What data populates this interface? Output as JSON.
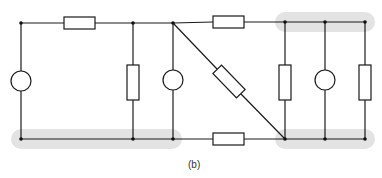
{
  "figure": {
    "label": "(b)",
    "label_position": {
      "x": 187,
      "y": 160
    }
  },
  "style": {
    "wire_color": "#1a1a1a",
    "highlight_color": "#e3e3e3",
    "background": "#ffffff",
    "wire_width": 1.2
  },
  "wires": {
    "top_y": 23,
    "bottom_y": 139
  },
  "nodes": [
    {
      "id": "n-top-left",
      "x": 21,
      "y": 23
    },
    {
      "id": "n-top-133",
      "x": 133,
      "y": 23
    },
    {
      "id": "n-top-173",
      "x": 173,
      "y": 23
    },
    {
      "id": "n-top-285",
      "x": 285,
      "y": 22
    },
    {
      "id": "n-top-325",
      "x": 325,
      "y": 22
    },
    {
      "id": "n-top-365",
      "x": 365,
      "y": 22
    },
    {
      "id": "n-bot-left",
      "x": 21,
      "y": 139
    },
    {
      "id": "n-bot-133",
      "x": 133,
      "y": 139
    },
    {
      "id": "n-bot-173",
      "x": 173,
      "y": 139
    },
    {
      "id": "n-bot-285",
      "x": 285,
      "y": 139
    },
    {
      "id": "n-bot-325",
      "x": 325,
      "y": 139
    },
    {
      "id": "n-bot-365",
      "x": 365,
      "y": 139
    }
  ],
  "highlights": [
    {
      "id": "top-right-node-group",
      "x": 275,
      "y": 12,
      "width": 100,
      "height": 20
    },
    {
      "id": "bottom-left-node-group",
      "x": 11,
      "y": 129,
      "width": 171,
      "height": 20
    },
    {
      "id": "bottom-right-node-group",
      "x": 275,
      "y": 129,
      "width": 100,
      "height": 20
    }
  ],
  "components": [
    {
      "id": "resistor-top-left",
      "type": "resistor",
      "orientation": "horizontal",
      "x": 64,
      "y": 17,
      "w": 31,
      "h": 13
    },
    {
      "id": "resistor-top-right",
      "type": "resistor",
      "orientation": "horizontal",
      "x": 213,
      "y": 16,
      "w": 31,
      "h": 13
    },
    {
      "id": "resistor-bottom",
      "type": "resistor",
      "orientation": "horizontal",
      "x": 213,
      "y": 133,
      "w": 31,
      "h": 13
    },
    {
      "id": "resistor-vertical-133",
      "type": "resistor",
      "orientation": "vertical",
      "x": 127,
      "y": 65,
      "w": 13,
      "h": 35
    },
    {
      "id": "resistor-vertical-285",
      "type": "resistor",
      "orientation": "vertical",
      "x": 279,
      "y": 65,
      "w": 13,
      "h": 35
    },
    {
      "id": "resistor-vertical-365",
      "type": "resistor",
      "orientation": "vertical",
      "x": 359,
      "y": 65,
      "w": 13,
      "h": 35
    },
    {
      "id": "source-left",
      "type": "source",
      "cx": 21,
      "cy": 81,
      "r": 10
    },
    {
      "id": "source-173",
      "type": "source",
      "cx": 173,
      "cy": 80,
      "r": 10
    },
    {
      "id": "source-325",
      "type": "source",
      "cx": 325,
      "cy": 80,
      "r": 10
    },
    {
      "id": "resistor-diagonal",
      "type": "resistor",
      "orientation": "diagonal",
      "cx": 229,
      "cy": 81,
      "length": 34,
      "thickness": 13,
      "angle": 46
    }
  ]
}
